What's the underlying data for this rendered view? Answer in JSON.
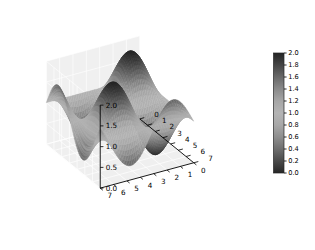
{
  "figure": {
    "background_color": "#ffffff",
    "width": 315,
    "height": 250
  },
  "chart_data": {
    "type": "surface",
    "title": "",
    "subtitle": "",
    "projection": "3d",
    "xlabel": "",
    "ylabel": "",
    "zlabel": "",
    "xlim": [
      0,
      7
    ],
    "ylim": [
      0,
      7
    ],
    "zlim": [
      0,
      2
    ],
    "x_ticks": [
      0,
      1,
      2,
      3,
      4,
      5,
      6,
      7
    ],
    "x_tick_labels": [
      "0",
      "1",
      "2",
      "3",
      "4",
      "5",
      "6",
      "7"
    ],
    "y_ticks": [
      0,
      1,
      2,
      3,
      4,
      5,
      6,
      7
    ],
    "y_tick_labels": [
      "0",
      "1",
      "2",
      "3",
      "4",
      "5",
      "6",
      "7"
    ],
    "z_ticks": [
      0.0,
      0.5,
      1.0,
      1.5,
      2.0
    ],
    "z_tick_labels": [
      "0.0",
      "0.5",
      "1.0",
      "1.5",
      "2.0"
    ],
    "grid": true,
    "legend": false,
    "legend_position": "none",
    "colormap": "grayscale",
    "function": "z = 1 + sin(x) * sin(y)",
    "surface_z_min": 0.0,
    "surface_z_max": 2.0,
    "sample_points": 56,
    "view_elevation": 28,
    "view_azimuth": -60,
    "pane_color": "#f0f0f0",
    "pane_grid_color": "#ffffff",
    "annotations": []
  },
  "colorbar": {
    "orientation": "vertical",
    "vmin": 0.0,
    "vmax": 2.0,
    "tick_values": [
      0.0,
      0.2,
      0.4,
      0.6,
      0.8,
      1.0,
      1.2,
      1.4,
      1.6,
      1.8,
      2.0
    ],
    "tick_labels": [
      "0.0",
      "0.2",
      "0.4",
      "0.6",
      "0.8",
      "1.0",
      "1.2",
      "1.4",
      "1.6",
      "1.8",
      "2.0"
    ],
    "gradient_stops": [
      {
        "value": 0.0,
        "color": "#262626"
      },
      {
        "value": 0.2,
        "color": "#4a4a4a"
      },
      {
        "value": 0.4,
        "color": "#6e6e6e"
      },
      {
        "value": 0.6,
        "color": "#8e8e8e"
      },
      {
        "value": 0.8,
        "color": "#a8a8a8"
      },
      {
        "value": 1.0,
        "color": "#b4b4b4"
      },
      {
        "value": 1.2,
        "color": "#a6a6a6"
      },
      {
        "value": 1.4,
        "color": "#8a8a8a"
      },
      {
        "value": 1.6,
        "color": "#696969"
      },
      {
        "value": 1.8,
        "color": "#454545"
      },
      {
        "value": 2.0,
        "color": "#242424"
      }
    ]
  }
}
